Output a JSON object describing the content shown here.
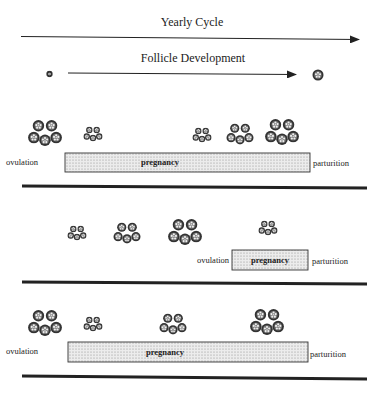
{
  "header": {
    "yearly_cycle_label": "Yearly Cycle",
    "follicle_development_label": "Follicle Development"
  },
  "legend": {
    "small_follicle": "small follicle (start)",
    "large_follicle": "large follicle (end)"
  },
  "rows": [
    {
      "ovulation_label": "ovulation",
      "pregnancy_label": "pregnancy",
      "parturition_label": "parturition",
      "clusters": [
        "large",
        "small",
        "small",
        "medium",
        "large"
      ]
    },
    {
      "ovulation_label": "ovulation",
      "pregnancy_label": "pregnancy",
      "parturition_label": "parturition",
      "clusters": [
        "small",
        "medium",
        "large",
        "small"
      ]
    },
    {
      "ovulation_label": "ovulation",
      "pregnancy_label": "pregnancy",
      "parturition_label": "parturition",
      "clusters": [
        "large",
        "small",
        "medium",
        "large"
      ]
    }
  ],
  "colors": {
    "ink": "#222222",
    "bar_fill": "#e6e6e6",
    "background": "#ffffff"
  }
}
